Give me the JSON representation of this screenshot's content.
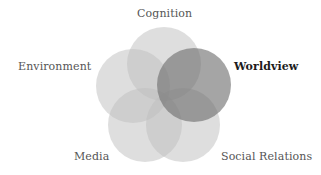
{
  "diagram": {
    "type": "venn",
    "circles": [
      {
        "key": "cognition",
        "label": "Cognition",
        "highlighted": false
      },
      {
        "key": "environment",
        "label": "Environment",
        "highlighted": false
      },
      {
        "key": "worldview",
        "label": "Worldview",
        "highlighted": true
      },
      {
        "key": "media",
        "label": "Media",
        "highlighted": false
      },
      {
        "key": "social",
        "label": "Social Relations",
        "highlighted": false
      }
    ],
    "colors": {
      "circle_fill": "#bdbdbd",
      "highlight_fill": "#6e6e6e",
      "label_text": "#555555",
      "highlight_text": "#1c1c1c"
    }
  }
}
